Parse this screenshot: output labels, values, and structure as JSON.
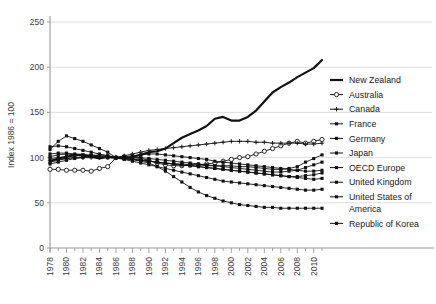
{
  "chart_data": {
    "type": "line",
    "title": "",
    "subtitle": "",
    "xlabel": "",
    "ylabel": "Index 1986 = 100",
    "xlim": [
      1978,
      2011
    ],
    "ylim": [
      0,
      250
    ],
    "yticks": [
      0,
      50,
      100,
      150,
      200,
      250
    ],
    "ytick_labels": [
      "0",
      "50",
      "100",
      "150",
      "200",
      "250"
    ],
    "xtick_labels": [
      "1978",
      "1980",
      "1982",
      "1984",
      "1986",
      "1988",
      "1990",
      "1992",
      "1994",
      "1996",
      "1998",
      "2000",
      "2002",
      "2004",
      "2006",
      "2008",
      "2010"
    ],
    "x": [
      1978,
      1979,
      1980,
      1981,
      1982,
      1983,
      1984,
      1985,
      1986,
      1987,
      1988,
      1989,
      1990,
      1991,
      1992,
      1993,
      1994,
      1995,
      1996,
      1997,
      1998,
      1999,
      2000,
      2001,
      2002,
      2003,
      2004,
      2005,
      2006,
      2007,
      2008,
      2009,
      2010,
      2011
    ],
    "grid": "horizontal",
    "legend_position": "right",
    "series": [
      {
        "name": "New Zealand",
        "color": "#111111",
        "marker": "none",
        "width": 2.2,
        "values": [
          96,
          99,
          101,
          103,
          103,
          101,
          99,
          101,
          100,
          99,
          101,
          103,
          106,
          107,
          110,
          116,
          122,
          126,
          130,
          135,
          143,
          145,
          141,
          141,
          145,
          152,
          162,
          172,
          178,
          183,
          189,
          194,
          199,
          208
        ]
      },
      {
        "name": "Australia",
        "color": "#111111",
        "marker": "open-circle",
        "width": 0.9,
        "values": [
          87,
          87,
          86,
          86,
          86,
          85,
          88,
          90,
          100,
          101,
          100,
          99,
          97,
          94,
          92,
          91,
          91,
          92,
          92,
          93,
          94,
          96,
          98,
          100,
          101,
          104,
          107,
          110,
          113,
          116,
          118,
          116,
          118,
          120
        ]
      },
      {
        "name": "Canada",
        "color": "#111111",
        "marker": "plus",
        "width": 0.9,
        "values": [
          97,
          98,
          99,
          100,
          100,
          100,
          100,
          100,
          100,
          102,
          104,
          106,
          108,
          109,
          110,
          111,
          112,
          113,
          114,
          115,
          116,
          117,
          118,
          118,
          118,
          117,
          117,
          116,
          116,
          116,
          116,
          115,
          115,
          116
        ]
      },
      {
        "name": "France",
        "color": "#111111",
        "marker": "filled-square",
        "width": 0.9,
        "values": [
          109,
          118,
          124,
          121,
          118,
          114,
          110,
          106,
          100,
          99,
          98,
          97,
          96,
          95,
          94,
          93,
          93,
          92,
          92,
          91,
          91,
          91,
          91,
          90,
          90,
          89,
          88,
          87,
          87,
          88,
          90,
          95,
          99,
          103
        ]
      },
      {
        "name": "Germany",
        "color": "#111111",
        "marker": "filled-square",
        "width": 0.9,
        "values": [
          112,
          113,
          112,
          110,
          108,
          106,
          104,
          102,
          100,
          99,
          98,
          97,
          96,
          95,
          94,
          93,
          92,
          91,
          90,
          89,
          88,
          87,
          86,
          85,
          84,
          83,
          82,
          81,
          80,
          79,
          79,
          80,
          81,
          83
        ]
      },
      {
        "name": "Japan",
        "color": "#111111",
        "marker": "filled-square",
        "width": 0.9,
        "values": [
          104,
          105,
          105,
          104,
          103,
          102,
          101,
          100,
          100,
          101,
          102,
          103,
          104,
          104,
          103,
          102,
          101,
          100,
          99,
          98,
          96,
          95,
          94,
          93,
          92,
          91,
          90,
          89,
          88,
          87,
          86,
          85,
          85,
          86
        ]
      },
      {
        "name": "OECD Europe",
        "color": "#111111",
        "marker": "filled-square",
        "width": 0.9,
        "values": [
          101,
          103,
          104,
          103,
          102,
          101,
          100,
          100,
          100,
          100,
          100,
          100,
          99,
          98,
          97,
          96,
          95,
          94,
          93,
          92,
          91,
          90,
          89,
          88,
          87,
          86,
          85,
          84,
          84,
          85,
          86,
          89,
          92,
          95
        ]
      },
      {
        "name": "United Kingdom",
        "color": "#111111",
        "marker": "filled-square",
        "width": 0.9,
        "values": [
          95,
          97,
          99,
          100,
          101,
          102,
          103,
          102,
          100,
          98,
          96,
          94,
          92,
          90,
          88,
          86,
          84,
          82,
          80,
          78,
          76,
          74,
          73,
          72,
          71,
          70,
          69,
          68,
          67,
          66,
          65,
          64,
          64,
          65
        ]
      },
      {
        "name": "United States of America",
        "color": "#111111",
        "marker": "filled-square",
        "width": 0.9,
        "values": [
          99,
          100,
          101,
          102,
          103,
          103,
          102,
          101,
          100,
          99,
          98,
          97,
          96,
          95,
          94,
          93,
          92,
          91,
          90,
          89,
          88,
          87,
          86,
          85,
          84,
          83,
          82,
          81,
          80,
          79,
          78,
          77,
          76,
          77
        ]
      },
      {
        "name": "Republic of Korea",
        "color": "#111111",
        "marker": "filled-square",
        "width": 0.9,
        "values": [
          93,
          95,
          97,
          99,
          100,
          101,
          101,
          100,
          100,
          99,
          98,
          96,
          94,
          90,
          85,
          79,
          73,
          67,
          62,
          58,
          55,
          52,
          50,
          48,
          47,
          46,
          45,
          45,
          44,
          44,
          44,
          44,
          44,
          44
        ]
      }
    ]
  },
  "legend": {
    "items": [
      {
        "label": "New Zealand",
        "marker": "line"
      },
      {
        "label": "Australia",
        "marker": "open-circle"
      },
      {
        "label": "Canada",
        "marker": "plus"
      },
      {
        "label": "France",
        "marker": "filled-square"
      },
      {
        "label": "Germany",
        "marker": "filled-square"
      },
      {
        "label": "Japan",
        "marker": "filled-square"
      },
      {
        "label": "OECD Europe",
        "marker": "filled-square"
      },
      {
        "label": "United Kingdom",
        "marker": "filled-square"
      },
      {
        "label": "United States of America",
        "marker": "filled-square"
      },
      {
        "label": "Republic of Korea",
        "marker": "filled-square"
      }
    ]
  },
  "colors": {
    "line": "#111111",
    "grid": "#d5d5d5",
    "axis": "#9a9a9a",
    "text": "#3c3c3c"
  }
}
